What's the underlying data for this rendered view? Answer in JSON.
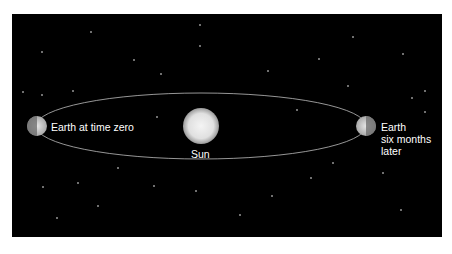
{
  "diagram": {
    "labels": {
      "earth_zero": "Earth at time zero",
      "sun": "Sun",
      "earth_later": "Earth\nsix months\nlater"
    },
    "colors": {
      "background": "#000000",
      "orbit": "#bdbdbd",
      "text": "#ffffff"
    },
    "stars": [
      [
        91,
        32
      ],
      [
        200,
        25
      ],
      [
        42,
        52
      ],
      [
        134,
        60
      ],
      [
        200,
        46
      ],
      [
        268,
        71
      ],
      [
        353,
        37
      ],
      [
        403,
        54
      ],
      [
        319,
        59
      ],
      [
        161,
        74
      ],
      [
        23,
        92
      ],
      [
        42,
        95
      ],
      [
        73,
        91
      ],
      [
        348,
        86
      ],
      [
        425,
        91
      ],
      [
        412,
        98
      ],
      [
        425,
        112
      ],
      [
        157,
        117
      ],
      [
        297,
        110
      ],
      [
        118,
        168
      ],
      [
        43,
        187
      ],
      [
        78,
        183
      ],
      [
        154,
        186
      ],
      [
        196,
        191
      ],
      [
        272,
        196
      ],
      [
        311,
        178
      ],
      [
        333,
        163
      ],
      [
        383,
        173
      ],
      [
        98,
        206
      ],
      [
        57,
        218
      ],
      [
        240,
        215
      ],
      [
        401,
        210
      ]
    ]
  }
}
